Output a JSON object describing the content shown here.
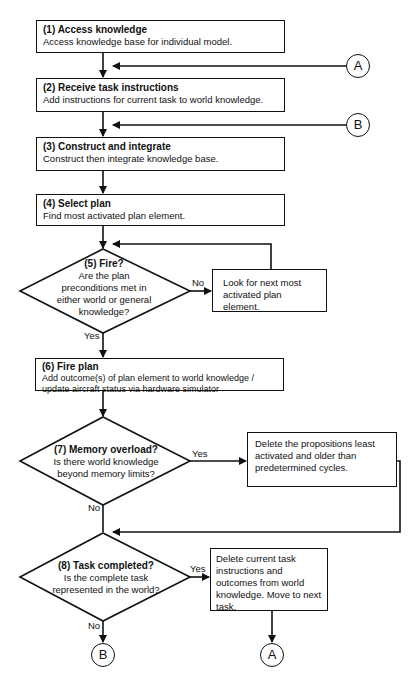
{
  "steps": {
    "s1": {
      "title": "(1) Access knowledge",
      "body": "Access knowledge base for individual model."
    },
    "s2": {
      "title": "(2) Receive task instructions",
      "body": "Add instructions for current task to world knowledge."
    },
    "s3": {
      "title": "(3) Construct and integrate",
      "body": "Construct then integrate knowledge base."
    },
    "s4": {
      "title": "(4) Select plan",
      "body": "Find most activated plan element."
    },
    "s5": {
      "title": "(5) Fire?",
      "body": "Are the plan preconditions met in either world or general knowledge?"
    },
    "s5_no": {
      "body": "Look for next most activated plan element."
    },
    "s6": {
      "title": "(6) Fire plan",
      "body": "Add outcome(s) of plan element to world knowledge / update aircraft status via hardware simulator"
    },
    "s7": {
      "title": "(7) Memory overload?",
      "body": "Is there world knowledge beyond memory limits?"
    },
    "s7_yes": {
      "body": "Delete the propositions least activated and older than predetermined cycles."
    },
    "s8": {
      "title": "(8) Task completed?",
      "body": "Is the complete task represented in the world?"
    },
    "s8_yes": {
      "body": "Delete current task instructions and outcomes from world knowledge. Move to next task."
    }
  },
  "labels": {
    "yes": "Yes",
    "no": "No"
  },
  "connectors": {
    "a": "A",
    "b": "B"
  }
}
